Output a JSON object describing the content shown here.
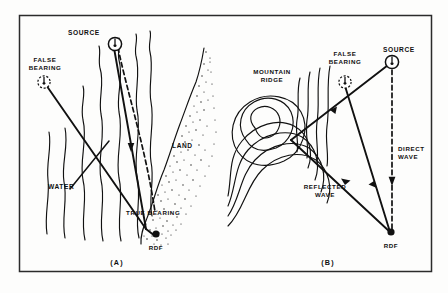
{
  "figure": {
    "panels": [
      {
        "tag": "(A)",
        "name": "coastal-refraction",
        "labels": {
          "source": "SOURCE",
          "false_bearing": "FALSE\nBEARING",
          "false_bearing_line1": "FALSE",
          "false_bearing_line2": "BEARING",
          "water": "WATER",
          "land": "LAND",
          "true_bearing": "TRUE  BEARING",
          "rdf": "RDF"
        }
      },
      {
        "tag": "(B)",
        "name": "mountain-reflection",
        "labels": {
          "source": "SOURCE",
          "false_bearing_line1": "FALSE",
          "false_bearing_line2": "BEARING",
          "mountain_ridge_line1": "MOUNTAIN",
          "mountain_ridge_line2": "RIDGE",
          "reflected_wave_line1": "REFLECTED",
          "reflected_wave_line2": "WAVE",
          "direct_wave_line1": "DIRECT",
          "direct_wave_line2": "WAVE",
          "rdf": "RDF"
        }
      }
    ],
    "colors": {
      "ink": "#111111",
      "frame": "#2b2b2b",
      "paper": "#fdfdfc"
    }
  }
}
